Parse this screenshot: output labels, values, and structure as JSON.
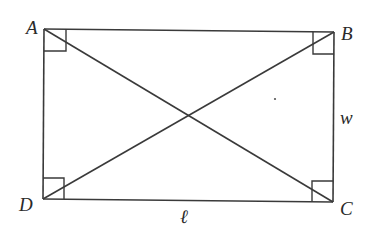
{
  "diagram": {
    "type": "rectangle-with-diagonals",
    "vertices": {
      "A": {
        "label": "A",
        "x": 44,
        "y": 29
      },
      "B": {
        "label": "B",
        "x": 334,
        "y": 32
      },
      "C": {
        "label": "C",
        "x": 333,
        "y": 202
      },
      "D": {
        "label": "D",
        "x": 43,
        "y": 199
      }
    },
    "side_labels": {
      "width": "w",
      "length": "ℓ"
    },
    "right_angle_marks": [
      "A",
      "B",
      "C",
      "D"
    ],
    "diagonals": [
      "AC",
      "BD"
    ],
    "colors": {
      "stroke": "#3a3a3a",
      "text": "#2a2a2a",
      "background": "#ffffff"
    }
  }
}
